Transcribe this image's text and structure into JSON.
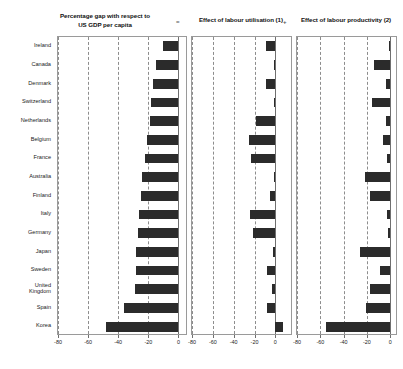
{
  "figure": {
    "separators": [
      "=",
      "+"
    ]
  },
  "chart_data": {
    "type": "bar",
    "orientation": "horizontal",
    "grid": true,
    "legend": false,
    "categories": [
      "Ireland",
      "Canada",
      "Denmark",
      "Switzerland",
      "Netherlands",
      "Belgium",
      "France",
      "Australia",
      "Finland",
      "Italy",
      "Germany",
      "Japan",
      "Sweden",
      "United\nKingdom",
      "Spain",
      "Korea"
    ],
    "panels": [
      {
        "title": "Percentage gap with respect to\nUS GDP per capita",
        "title_line1": "Percentage gap with respect to",
        "title_line2": "US GDP per capita",
        "xlabel": "",
        "ylabel": "",
        "xlim": [
          -80,
          5
        ],
        "ticks": [
          -80,
          -60,
          -40,
          -20,
          0
        ],
        "ticklabels": [
          "-80",
          "-60",
          "-40",
          "-20",
          "0"
        ],
        "values": [
          -10,
          -15,
          -17,
          -18,
          -19,
          -21,
          -22,
          -24,
          -25,
          -26,
          -27,
          -28,
          -28,
          -29,
          -36,
          -48
        ]
      },
      {
        "title": "Effect of labour utilisation (1)",
        "title_line1": "Effect of labour utilisation (1)",
        "title_line2": "",
        "xlabel": "",
        "ylabel": "",
        "xlim": [
          -80,
          15
        ],
        "ticks": [
          -80,
          -60,
          -40,
          -20,
          0
        ],
        "ticklabels": [
          "-80",
          "-60",
          "-40",
          "-20",
          "0"
        ],
        "values": [
          -9,
          -1.5,
          -9,
          -1.5,
          -19,
          -25,
          -23,
          -1.5,
          -5,
          -24,
          -21,
          -2,
          -8,
          -3.5,
          -8,
          7
        ]
      },
      {
        "title": "Effect of labour productivity (2)",
        "title_line1": "Effect of labour productivity (2)",
        "title_line2": "",
        "xlabel": "",
        "ylabel": "",
        "xlim": [
          -80,
          5
        ],
        "ticks": [
          -80,
          -60,
          -40,
          -20,
          0
        ],
        "ticklabels": [
          "-80",
          "-60",
          "-40",
          "-20",
          "0"
        ],
        "values": [
          -1,
          -14,
          -4,
          -16,
          -3.5,
          -6,
          -2.5,
          -22,
          -17,
          -3,
          -1.5,
          -26,
          -9,
          -17,
          -21,
          -55
        ]
      }
    ]
  }
}
